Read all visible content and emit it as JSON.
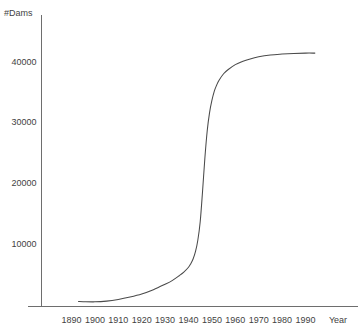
{
  "chart_data": {
    "type": "line",
    "title": "",
    "subtitle": "",
    "xlabel": "Year",
    "ylabel": "#Dams",
    "xlim": [
      1885,
      1998
    ],
    "ylim": [
      0,
      45000
    ],
    "grid": false,
    "legend": null,
    "legend_position": "none",
    "x_ticks": [
      1890,
      1900,
      1910,
      1920,
      1930,
      1940,
      1950,
      1960,
      1970,
      1980,
      1990
    ],
    "x_tick_labels": [
      "1890",
      "1900",
      "1910",
      "1920",
      "1930",
      "1940",
      "1950",
      "1960",
      "1970",
      "1980",
      "1990"
    ],
    "y_ticks": [
      10000,
      20000,
      30000,
      40000
    ],
    "y_tick_labels": [
      "10000",
      "20000",
      "30000",
      "40000"
    ],
    "series": [
      {
        "name": "Cumulative number of dams",
        "color": "#4a4a4a",
        "x": [
          1893,
          1895,
          1900,
          1905,
          1910,
          1915,
          1920,
          1925,
          1930,
          1933,
          1936,
          1938,
          1940,
          1941,
          1942,
          1943,
          1944,
          1945,
          1946,
          1947,
          1948,
          1949,
          1950,
          1951,
          1952,
          1953,
          1955,
          1957,
          1960,
          1963,
          1966,
          1970,
          1975,
          1980,
          1985,
          1990,
          1994
        ],
        "values": [
          350,
          330,
          300,
          420,
          700,
          1100,
          1600,
          2300,
          3200,
          3800,
          4600,
          5200,
          6000,
          6600,
          7400,
          8600,
          10500,
          13500,
          18500,
          24000,
          28500,
          31500,
          33500,
          35000,
          36000,
          36800,
          37900,
          38600,
          39400,
          39900,
          40300,
          40700,
          41000,
          41150,
          41250,
          41300,
          41300
        ]
      }
    ],
    "annotations": []
  },
  "axis": {
    "y_title": "#Dams",
    "x_title": "Year"
  }
}
